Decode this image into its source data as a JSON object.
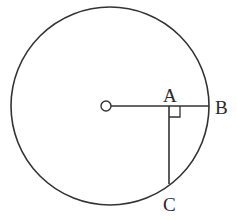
{
  "diagram": {
    "type": "circle-geometry",
    "circle": {
      "cx": 110,
      "cy": 106,
      "r": 99,
      "stroke": "#333333"
    },
    "center_marker": {
      "cx": 106,
      "cy": 106,
      "r": 5,
      "label": "O"
    },
    "points": [
      {
        "id": "A",
        "label": "A",
        "x": 169,
        "y": 106
      },
      {
        "id": "B",
        "label": "B",
        "x": 209,
        "y": 106
      },
      {
        "id": "C",
        "label": "C",
        "x": 169,
        "y": 184
      }
    ],
    "segments": [
      {
        "from": "O",
        "to": "B"
      },
      {
        "from": "A",
        "to": "C"
      }
    ],
    "right_angle_at": "A",
    "colors": {
      "line": "#333333",
      "background": "#ffffff"
    }
  }
}
